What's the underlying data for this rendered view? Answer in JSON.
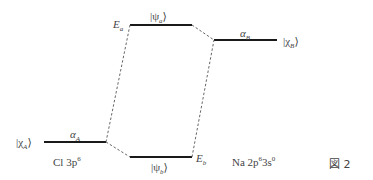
{
  "figure": {
    "caption": "図 2",
    "atom_A": {
      "ket": "|χ",
      "sub": "A",
      "close": "⟩",
      "energy": "α",
      "energy_sub": "A",
      "config": "Cl 3p",
      "config_sup": "6"
    },
    "atom_B": {
      "ket": "|χ",
      "sub": "B",
      "close": "⟩",
      "energy": "α",
      "energy_sub": "B",
      "config_na": "Na 2p",
      "config_sup1": "6",
      "config_mid": "3s",
      "config_sup2": "0"
    },
    "antibonding": {
      "ket": "|ψ",
      "sub": "a",
      "close": "⟩",
      "energy": "E",
      "energy_sub": "a"
    },
    "bonding": {
      "ket": "|ψ",
      "sub": "b",
      "close": "⟩",
      "energy": "E",
      "energy_sub": "b"
    }
  },
  "colors": {
    "line": "#1a1a1a",
    "dash": "#555555",
    "text": "#444444"
  }
}
